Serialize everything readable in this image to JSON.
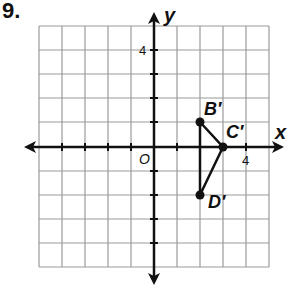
{
  "problem": {
    "number": "9."
  },
  "graph": {
    "x_axis_label": "x",
    "y_axis_label": "y",
    "origin_label": "O",
    "tick_labels": {
      "x": "4",
      "y": "4"
    },
    "grid": {
      "x_min": -5,
      "x_max": 5,
      "y_min": -5,
      "y_max": 5,
      "step": 1
    },
    "colors": {
      "grid": "#9a9a9a",
      "axis": "#111111",
      "figure": "#111111"
    }
  },
  "points": [
    {
      "label": "B′",
      "x": 2,
      "y": 1
    },
    {
      "label": "C′",
      "x": 3,
      "y": 0
    },
    {
      "label": "D′",
      "x": 2,
      "y": -2
    }
  ],
  "figure": {
    "type": "triangle",
    "vertices": [
      "B′",
      "C′",
      "D′"
    ]
  }
}
